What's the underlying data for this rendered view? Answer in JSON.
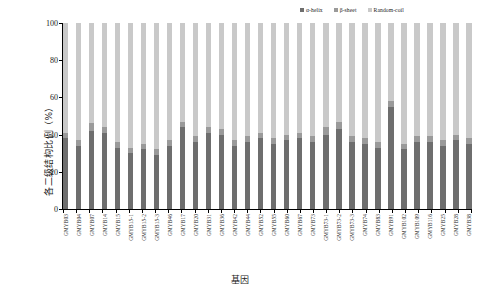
{
  "chart_data": {
    "type": "bar",
    "stacked": true,
    "title": "",
    "xlabel": "基因",
    "ylabel": "各二级结构比例（%）",
    "ylim": [
      0,
      100
    ],
    "yticks": [
      0,
      20,
      40,
      60,
      80,
      100
    ],
    "grid": false,
    "legend_position": "top-right",
    "categories": [
      "GMYB03",
      "GMYB04",
      "GMYB07",
      "GMYB14",
      "GMYB15",
      "GMYB15-1",
      "GMYB15-2",
      "GMYB15-3",
      "GMYB46",
      "GMYB17",
      "GMYB20",
      "GMYB31",
      "GMYB36",
      "GMYB42",
      "GMYB44",
      "GMYB52",
      "GMYB55",
      "GMYB60",
      "GMYB67",
      "GMYB73",
      "GMYB73-1",
      "GMYB73-2",
      "GMYB73-3",
      "GMYB74",
      "GMYB83",
      "GMYB91",
      "GMYB102",
      "GMYB109",
      "GMYB116",
      "GMYB25",
      "GMYB28",
      "GMYB38"
    ],
    "series": [
      {
        "name": "α-helix",
        "color": "#6e6e6e",
        "values": [
          38,
          34,
          42,
          41,
          33,
          30,
          32,
          29,
          34,
          44,
          36,
          41,
          40,
          34,
          36,
          38,
          35,
          37,
          38,
          36,
          40,
          43,
          36,
          35,
          33,
          55,
          32,
          36,
          36,
          34,
          37,
          35
        ]
      },
      {
        "name": "β-sheet",
        "color": "#9a9a9a",
        "values": [
          3,
          3,
          4,
          3,
          3,
          3,
          3,
          3,
          3,
          3,
          3,
          3,
          3,
          3,
          3,
          3,
          3,
          3,
          3,
          3,
          4,
          4,
          3,
          3,
          3,
          3,
          3,
          3,
          3,
          3,
          3,
          3
        ]
      },
      {
        "name": "Random-coil",
        "color": "#c9c9c9",
        "values": [
          59,
          63,
          54,
          56,
          64,
          67,
          65,
          68,
          63,
          53,
          61,
          56,
          57,
          63,
          61,
          59,
          62,
          60,
          59,
          61,
          56,
          53,
          61,
          62,
          64,
          42,
          65,
          61,
          61,
          63,
          60,
          62
        ]
      }
    ]
  },
  "legend": {
    "items": [
      {
        "label": "α-helix"
      },
      {
        "label": "β-sheet"
      },
      {
        "label": "Random-coil"
      }
    ]
  }
}
